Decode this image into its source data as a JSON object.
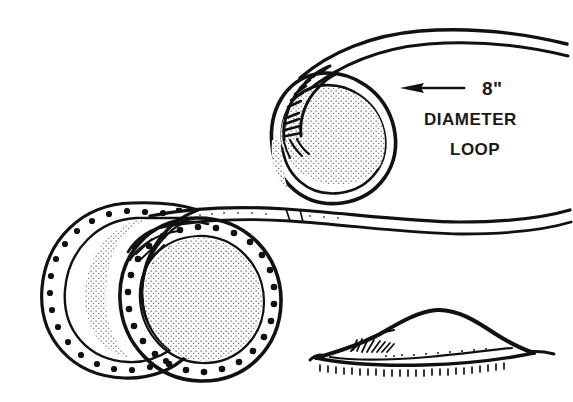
{
  "figure": {
    "background_color": "#ffffff",
    "ink_color": "#111111",
    "width": 573,
    "height": 402
  },
  "annotations": {
    "dimension_label": "8\"",
    "line_two": "DIAMETER",
    "line_three": "LOOP",
    "arrow_direction": "left",
    "arrow_points_to": "loop"
  },
  "views": [
    {
      "id": "loop-detail",
      "name": "8 inch diameter loop with whipping",
      "position": "top-right",
      "elements": [
        "hose-tail",
        "loop-ring",
        "whipping-wrap",
        "hose-end-strands"
      ]
    },
    {
      "id": "coil-front",
      "name": "Front view of coiled hose",
      "position": "lower-left",
      "elements": [
        "rear-ring",
        "front-ring",
        "dot-band",
        "stipple-shading",
        "hatching",
        "hose-tail"
      ]
    },
    {
      "id": "coil-profile",
      "name": "Side profile of coiled hose lying flat",
      "position": "lower-right",
      "elements": [
        "profile-outline",
        "base-line",
        "hatching",
        "ground-ticks"
      ]
    }
  ],
  "style": {
    "technique": "pen-and-ink line art",
    "shading": "stipple and hatching",
    "colors": [
      "#111111",
      "#ffffff"
    ]
  }
}
